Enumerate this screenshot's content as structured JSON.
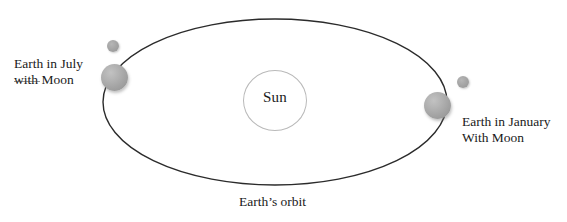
{
  "diagram": {
    "background_color": "#ffffff",
    "orbit": {
      "name": "Earth's orbit",
      "caption": "Earth’s orbit",
      "shape": "ellipse",
      "stroke_color": "#2b2b2b",
      "center_x": 275,
      "center_y": 102,
      "radius_x": 172,
      "radius_y": 83
    },
    "sun": {
      "label": "Sun",
      "fill_color": "#ffffff",
      "outline_color": "#b9b9b9",
      "center_x": 275,
      "center_y": 100
    },
    "bodies": [
      {
        "id": "earth-july",
        "type": "earth",
        "color": "#a8a8a8",
        "center_x": 114,
        "center_y": 77
      },
      {
        "id": "moon-july",
        "type": "moon",
        "color": "#a2a2a2",
        "center_x": 113,
        "center_y": 46
      },
      {
        "id": "earth-january",
        "type": "earth",
        "color": "#a8a8a8",
        "center_x": 437,
        "center_y": 105
      },
      {
        "id": "moon-january",
        "type": "moon",
        "color": "#a2a2a2",
        "center_x": 463,
        "center_y": 82
      }
    ],
    "labels": {
      "july": {
        "line1": "Earth in July",
        "line2": "with Moon"
      },
      "january": {
        "line1": "Earth in January",
        "line2": "With Moon"
      }
    }
  }
}
